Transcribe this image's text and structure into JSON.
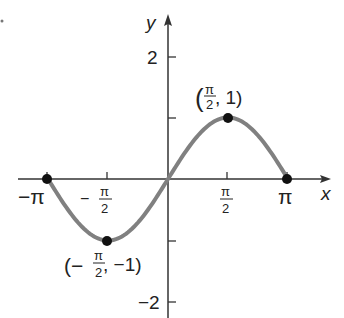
{
  "chart_data": {
    "type": "line",
    "title": "",
    "function": "y = sin x",
    "xlabel": "x",
    "ylabel": "y",
    "xlim": [
      -3.14159,
      3.14159
    ],
    "ylim": [
      -2,
      2
    ],
    "grid": false,
    "x_ticks": [
      {
        "value": -3.14159,
        "label": "−π"
      },
      {
        "value": -1.5708,
        "label": "−π/2"
      },
      {
        "value": 1.5708,
        "label": "π/2"
      },
      {
        "value": 3.14159,
        "label": "π"
      }
    ],
    "y_ticks": [
      {
        "value": 2,
        "label": "2"
      },
      {
        "value": 1,
        "label": ""
      },
      {
        "value": -1,
        "label": ""
      },
      {
        "value": -2,
        "label": "−2"
      }
    ],
    "series": [
      {
        "name": "sin x",
        "color": "#808080",
        "x": [
          -3.14159,
          -2.35619,
          -1.5708,
          -0.7854,
          0,
          0.7854,
          1.5708,
          2.35619,
          3.14159
        ],
        "y": [
          0,
          -0.7071,
          -1,
          -0.7071,
          0,
          0.7071,
          1,
          0.7071,
          0
        ]
      }
    ],
    "points": [
      {
        "x": -3.14159,
        "y": 0,
        "label": ""
      },
      {
        "x": -1.5708,
        "y": -1,
        "label": "(−π/2, −1)"
      },
      {
        "x": 1.5708,
        "y": 1,
        "label": "(π/2, 1)"
      },
      {
        "x": 3.14159,
        "y": 0,
        "label": ""
      }
    ],
    "annotations": [
      "(π/2, 1)",
      "(−π/2, −1)"
    ]
  },
  "labels": {
    "x_axis": "x",
    "y_axis": "y",
    "tick_neg_pi": "−π",
    "tick_pi": "π",
    "tick_pi_num": "π",
    "tick_den": "2",
    "tick_minus": "−",
    "tick_y2": "2",
    "tick_yneg2": "−2",
    "max_point_open": "(",
    "max_point_y": ", 1)",
    "min_point_open": "(−",
    "min_point_y": ", −1)"
  },
  "colors": {
    "curve": "#808080",
    "axis": "#333333",
    "point": "#111111"
  }
}
